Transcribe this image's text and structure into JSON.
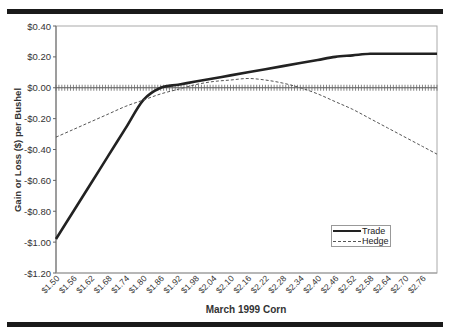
{
  "chart_data": {
    "type": "line",
    "title": "",
    "xlabel": "March 1999 Corn",
    "ylabel": "Gain or Loss ($) per Bushel",
    "ylim": [
      -1.2,
      0.4
    ],
    "y_ticks": [
      "$0.40",
      "$0.20",
      "$0.00",
      "-$0.20",
      "-$0.40",
      "-$0.60",
      "-$0.80",
      "-$1.00",
      "-$1.20"
    ],
    "y_tick_values": [
      0.4,
      0.2,
      0.0,
      -0.2,
      -0.4,
      -0.6,
      -0.8,
      -1.0,
      -1.2
    ],
    "x_tick_labels": [
      "$1.50",
      "$1.56",
      "$1.62",
      "$1.68",
      "$1.74",
      "$1.80",
      "$1.86",
      "$1.92",
      "$1.98",
      "$2.04",
      "$2.10",
      "$2.16",
      "$2.22",
      "$2.28",
      "$2.34",
      "$2.40",
      "$2.46",
      "$2.52",
      "$2.58",
      "$2.64",
      "$2.70",
      "$2.76"
    ],
    "xlim": [
      1.5,
      2.81
    ],
    "grid": false,
    "legend_position": "lower right inside",
    "x": [
      1.5,
      1.56,
      1.62,
      1.68,
      1.74,
      1.8,
      1.86,
      1.92,
      1.98,
      2.04,
      2.1,
      2.16,
      2.22,
      2.28,
      2.34,
      2.4,
      2.46,
      2.52,
      2.58,
      2.64,
      2.7,
      2.76,
      2.81
    ],
    "series": [
      {
        "name": "Trade",
        "style": "solid-thick",
        "color": "#222222",
        "values": [
          -0.98,
          -0.8,
          -0.62,
          -0.44,
          -0.26,
          -0.08,
          0.0,
          0.02,
          0.04,
          0.06,
          0.08,
          0.1,
          0.12,
          0.14,
          0.16,
          0.18,
          0.2,
          0.21,
          0.22,
          0.22,
          0.22,
          0.22,
          0.22
        ]
      },
      {
        "name": "Hedge",
        "style": "dashed",
        "color": "#555555",
        "values": [
          -0.32,
          -0.27,
          -0.22,
          -0.17,
          -0.12,
          -0.08,
          -0.04,
          -0.01,
          0.02,
          0.04,
          0.05,
          0.06,
          0.05,
          0.03,
          0.0,
          -0.04,
          -0.09,
          -0.14,
          -0.2,
          -0.26,
          -0.32,
          -0.38,
          -0.43
        ]
      }
    ]
  },
  "legend": {
    "items": [
      {
        "label": "Trade"
      },
      {
        "label": "Hedge"
      }
    ]
  }
}
